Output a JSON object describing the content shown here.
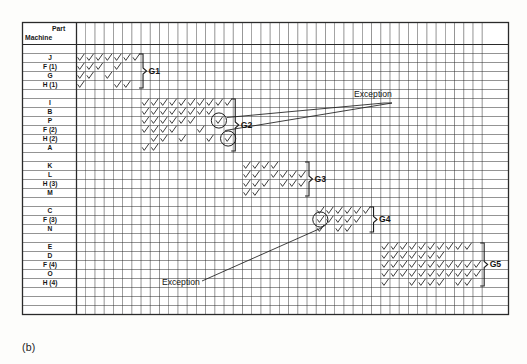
{
  "figure": {
    "caption": "(b)",
    "corner_label_part": "Part",
    "corner_label_machine": "Machine",
    "type": "machine-part incidence matrix (group technology block diagonalization)"
  },
  "grid": {
    "columns": 44,
    "col_width": 9.22,
    "row_height": 9.0,
    "left": 76,
    "top": 22,
    "right": 508,
    "bottom": 334,
    "header_rows": 2,
    "line_color": "#2a2a2a",
    "check_color": "#333333"
  },
  "rows": [
    {
      "id": "sp0",
      "label": "",
      "kind": "spacer"
    },
    {
      "id": "J",
      "label": "J",
      "kind": "machine",
      "group": "G1"
    },
    {
      "id": "F1",
      "label": "F (1)",
      "kind": "machine",
      "group": "G1"
    },
    {
      "id": "G",
      "label": "G",
      "kind": "machine",
      "group": "G1"
    },
    {
      "id": "H1",
      "label": "H (1)",
      "kind": "machine",
      "group": "G1"
    },
    {
      "id": "sp1",
      "label": "",
      "kind": "spacer"
    },
    {
      "id": "I",
      "label": "I",
      "kind": "machine",
      "group": "G2"
    },
    {
      "id": "B",
      "label": "B",
      "kind": "machine",
      "group": "G2"
    },
    {
      "id": "P",
      "label": "P",
      "kind": "machine",
      "group": "G2"
    },
    {
      "id": "F2",
      "label": "F (2)",
      "kind": "machine",
      "group": "G2"
    },
    {
      "id": "H2",
      "label": "H (2)",
      "kind": "machine",
      "group": "G2"
    },
    {
      "id": "A",
      "label": "A",
      "kind": "machine",
      "group": "G2"
    },
    {
      "id": "sp2",
      "label": "",
      "kind": "spacer"
    },
    {
      "id": "K",
      "label": "K",
      "kind": "machine",
      "group": "G3"
    },
    {
      "id": "L",
      "label": "L",
      "kind": "machine",
      "group": "G3"
    },
    {
      "id": "H3",
      "label": "H (3)",
      "kind": "machine",
      "group": "G3"
    },
    {
      "id": "M",
      "label": "M",
      "kind": "machine",
      "group": "G3"
    },
    {
      "id": "sp3",
      "label": "",
      "kind": "spacer"
    },
    {
      "id": "C",
      "label": "C",
      "kind": "machine",
      "group": "G4"
    },
    {
      "id": "F3",
      "label": "F (3)",
      "kind": "machine",
      "group": "G4"
    },
    {
      "id": "N",
      "label": "N",
      "kind": "machine",
      "group": "G4"
    },
    {
      "id": "sp4",
      "label": "",
      "kind": "spacer"
    },
    {
      "id": "E",
      "label": "E",
      "kind": "machine",
      "group": "G5"
    },
    {
      "id": "D",
      "label": "D",
      "kind": "machine",
      "group": "G5"
    },
    {
      "id": "F4",
      "label": "F (4)",
      "kind": "machine",
      "group": "G5"
    },
    {
      "id": "O",
      "label": "O",
      "kind": "machine",
      "group": "G5"
    },
    {
      "id": "H4",
      "label": "H (4)",
      "kind": "machine",
      "group": "G5"
    },
    {
      "id": "sp5",
      "label": "",
      "kind": "spacer"
    },
    {
      "id": "sp6",
      "label": "",
      "kind": "spacer"
    },
    {
      "id": "sp7",
      "label": "",
      "kind": "spacer"
    }
  ],
  "chart_data": {
    "type": "heatmap",
    "title": "",
    "xlabel": "Part",
    "ylabel": "Machine",
    "grid": true,
    "legend": "none",
    "note": "cell value 1 = machine processes part (check mark), 0 = blank",
    "categories": [
      "1",
      "2",
      "3",
      "4",
      "5",
      "6",
      "7",
      "8",
      "9",
      "10",
      "11",
      "12",
      "13",
      "14",
      "15",
      "16",
      "17",
      "18",
      "19",
      "20",
      "21",
      "22",
      "23",
      "24",
      "25",
      "26",
      "27",
      "28",
      "29",
      "30",
      "31",
      "32",
      "33",
      "34",
      "35",
      "36",
      "37",
      "38",
      "39",
      "40",
      "41",
      "42",
      "43",
      "44"
    ],
    "row_names": [
      "J",
      "F (1)",
      "G",
      "H (1)",
      "I",
      "B",
      "P",
      "F (2)",
      "H (2)",
      "A",
      "K",
      "L",
      "H (3)",
      "M",
      "C",
      "F (3)",
      "N",
      "E",
      "D",
      "F (4)",
      "O",
      "H (4)"
    ],
    "marks": {
      "J": [
        0,
        1,
        2,
        3,
        4,
        5,
        6
      ],
      "F (1)": [
        0,
        1,
        2,
        4
      ],
      "G": [
        0,
        1,
        3
      ],
      "H (1)": [
        0,
        4,
        5
      ],
      "I": [
        7,
        8,
        9,
        10,
        11,
        12,
        13,
        14,
        15,
        16
      ],
      "B": [
        7,
        8,
        9,
        10,
        11,
        12,
        13,
        14
      ],
      "P": [
        7,
        8,
        9,
        10,
        11,
        12,
        15
      ],
      "F (2)": [
        7,
        8,
        9,
        10,
        13
      ],
      "H (2)": [
        8,
        9,
        11,
        14,
        16
      ],
      "A": [
        7,
        8
      ],
      "K": [
        18,
        19,
        20,
        21
      ],
      "L": [
        18,
        19,
        21,
        22,
        23,
        24
      ],
      "H (3)": [
        18,
        19,
        20,
        22,
        23,
        24
      ],
      "M": [
        18,
        19
      ],
      "C": [
        26,
        27,
        28,
        29,
        30,
        31
      ],
      "F (3)": [
        26,
        27,
        28,
        29,
        30
      ],
      "N": [
        26,
        28,
        29
      ],
      "E": [
        33,
        34,
        35,
        36,
        37,
        38,
        39,
        40,
        41,
        42
      ],
      "D": [
        33,
        34,
        35,
        36,
        37,
        38,
        39
      ],
      "F (4)": [
        33,
        34,
        35,
        36,
        37,
        38,
        39,
        40,
        41,
        42,
        43
      ],
      "O": [
        33,
        34,
        35,
        36,
        37,
        38,
        39,
        40,
        41,
        42,
        43
      ],
      "H (4)": [
        33,
        36,
        37,
        38,
        39,
        41,
        42
      ]
    },
    "exceptions": [
      {
        "row": "P",
        "col": 15,
        "label": "Exception"
      },
      {
        "row": "H (2)",
        "col": 16,
        "label": "Exception"
      },
      {
        "row": "F (3)",
        "col": 26,
        "label": "Exception"
      }
    ]
  },
  "groups": [
    {
      "name": "G1",
      "first_row": "J",
      "last_row": "H (1)",
      "bracket_col": 7
    },
    {
      "name": "G2",
      "first_row": "I",
      "last_row": "A",
      "bracket_col": 17
    },
    {
      "name": "G3",
      "first_row": "K",
      "last_row": "M",
      "bracket_col": 25
    },
    {
      "name": "G4",
      "first_row": "C",
      "last_row": "N",
      "bracket_col": 32
    },
    {
      "name": "G5",
      "first_row": "E",
      "last_row": "H (4)",
      "bracket_col": 44
    }
  ],
  "annotations": [
    {
      "id": "exception-top",
      "text": "Exception",
      "x": 362,
      "y": 96
    },
    {
      "id": "exception-bottom",
      "text": "Exception",
      "x": 168,
      "y": 283
    }
  ]
}
